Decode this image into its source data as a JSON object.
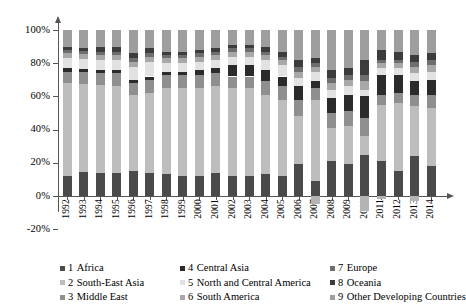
{
  "chart_data": {
    "type": "bar",
    "subtype": "stacked-percent",
    "title": "",
    "xlabel": "",
    "ylabel": "",
    "ylim": [
      -20,
      100
    ],
    "yticks": [
      -20,
      0,
      20,
      40,
      60,
      80,
      100
    ],
    "ytick_labels": [
      "-20%",
      "0%",
      "20%",
      "40%",
      "60%",
      "80%",
      "100%"
    ],
    "grid": false,
    "legend_position": "bottom",
    "categories": [
      "1992",
      "1993",
      "1994",
      "1995",
      "1996",
      "1997",
      "1998",
      "1999",
      "2000",
      "2001",
      "2002",
      "2003",
      "2004",
      "2005",
      "2006",
      "2007",
      "2008",
      "2009",
      "2010",
      "2011",
      "2012",
      "2013",
      "2014"
    ],
    "series": [
      {
        "name": "1  Africa",
        "number": "1",
        "label": "Africa",
        "color": "#4a4a4a",
        "values": [
          12,
          15,
          14,
          14,
          15,
          14,
          13,
          12,
          12,
          14,
          12,
          12,
          13,
          12,
          19,
          9,
          21,
          19,
          25,
          21,
          15,
          24,
          18
        ]
      },
      {
        "name": "2  South-East Asia",
        "number": "2",
        "label": "South-East Asia",
        "color": "#bdbdbd",
        "values": [
          56,
          54,
          53,
          52,
          46,
          48,
          52,
          53,
          53,
          52,
          53,
          53,
          48,
          46,
          29,
          49,
          20,
          23,
          11,
          34,
          41,
          30,
          35
        ]
      },
      {
        "name": "3  Middle East",
        "number": "3",
        "label": "Middle East",
        "color": "#8f8f8f",
        "values": [
          7,
          7,
          7,
          8,
          7,
          8,
          8,
          8,
          8,
          8,
          7,
          7,
          8,
          8,
          10,
          7,
          9,
          9,
          11,
          6,
          6,
          7,
          8
        ]
      },
      {
        "name": "4  Central Asia",
        "number": "4",
        "label": "Central Asia",
        "color": "#2b2b2b",
        "values": [
          2,
          2,
          2,
          2,
          2,
          2,
          2,
          2,
          3,
          3,
          7,
          7,
          7,
          6,
          8,
          4,
          9,
          10,
          13,
          12,
          11,
          8,
          9
        ]
      },
      {
        "name": "5  North and Central America",
        "number": "5",
        "label": "North and Central America",
        "color": "#e2e2e2",
        "values": [
          6,
          6,
          6,
          6,
          8,
          9,
          5,
          5,
          5,
          5,
          5,
          5,
          6,
          7,
          5,
          6,
          5,
          5,
          4,
          4,
          4,
          5,
          5
        ]
      },
      {
        "name": "6  South America",
        "number": "6",
        "label": "South America",
        "color": "#a8a8a8",
        "values": [
          3,
          3,
          3,
          3,
          3,
          3,
          3,
          3,
          3,
          3,
          3,
          3,
          3,
          3,
          4,
          3,
          4,
          4,
          5,
          3,
          3,
          4,
          4
        ]
      },
      {
        "name": "7  Europe",
        "number": "7",
        "label": "Europe",
        "color": "#6e6e6e",
        "values": [
          2,
          2,
          2,
          2,
          2,
          2,
          2,
          2,
          2,
          2,
          2,
          2,
          2,
          2,
          3,
          2,
          3,
          3,
          4,
          2,
          2,
          3,
          3
        ]
      },
      {
        "name": "8  Oceania",
        "number": "8",
        "label": "Oceania",
        "color": "#3c3c3c",
        "values": [
          2,
          2,
          3,
          3,
          3,
          3,
          2,
          2,
          2,
          2,
          2,
          2,
          3,
          3,
          4,
          3,
          5,
          4,
          9,
          6,
          5,
          4,
          4
        ]
      },
      {
        "name": "9  Other Developing Countries",
        "number": "9",
        "label": "Other Developing Countries",
        "color": "#9e9e9e",
        "values": [
          10,
          11,
          10,
          10,
          14,
          11,
          13,
          13,
          12,
          11,
          9,
          9,
          10,
          13,
          18,
          17,
          24,
          23,
          18,
          12,
          13,
          15,
          14
        ]
      }
    ],
    "negative_note": "Some years show segments extending below the 0% baseline.",
    "negative_bars": [
      {
        "category": "2007",
        "value": -5
      },
      {
        "category": "2010",
        "value": -9
      },
      {
        "category": "2011",
        "value": -2
      },
      {
        "category": "2013",
        "value": -3
      }
    ]
  },
  "legend": {
    "columns": 3,
    "items": [
      {
        "number": "1",
        "label": "Africa"
      },
      {
        "number": "4",
        "label": "Central Asia"
      },
      {
        "number": "7",
        "label": "Europe"
      },
      {
        "number": "2",
        "label": "South-East Asia"
      },
      {
        "number": "5",
        "label": "North and Central America"
      },
      {
        "number": "8",
        "label": "Oceania"
      },
      {
        "number": "3",
        "label": "Middle East"
      },
      {
        "number": "6",
        "label": "South America"
      },
      {
        "number": "9",
        "label": "Other Developing Countries"
      }
    ]
  }
}
